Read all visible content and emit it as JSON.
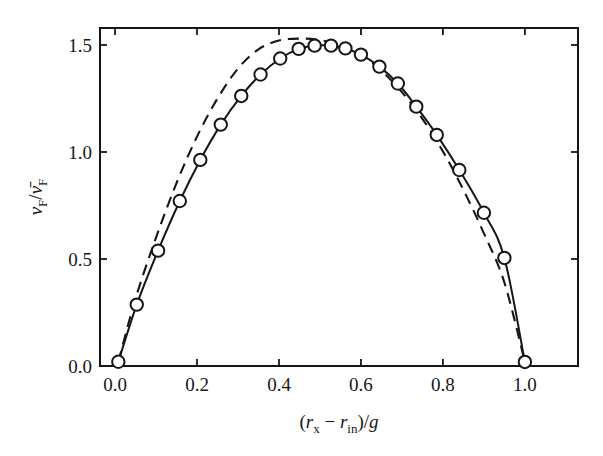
{
  "figure": {
    "title": "",
    "background_color": "#ffffff",
    "ink_color": "#161616"
  },
  "axes": {
    "x": {
      "label_parts": {
        "open_paren": "(",
        "r1": "r",
        "r1_sub": "x",
        "minus": "−",
        "r2": "r",
        "r2_sub": "in",
        "close_paren": ")",
        "slash": "/",
        "g": "g"
      },
      "label_plain": "(r_x − r_in)/g",
      "tick_labels": [
        "0.0",
        "0.2",
        "0.4",
        "0.6",
        "0.8",
        "1.0"
      ],
      "tick_values": [
        0.0,
        0.2,
        0.4,
        0.6,
        0.8,
        1.0
      ],
      "limits": [
        -0.0367,
        1.1296
      ],
      "minor_ticks": false,
      "tick_direction": "in"
    },
    "y": {
      "label_parts": {
        "nu1": "ν",
        "nu1_sub": "F",
        "slash": "/",
        "nu2_bar": "ν̄",
        "nu2_sub": "F"
      },
      "label_plain": "ν_F / ν̄_F",
      "tick_labels": [
        "0.0",
        "0.5",
        "1.0",
        "1.5"
      ],
      "tick_values": [
        0.0,
        0.5,
        1.0,
        1.5
      ],
      "limits": [
        0.0,
        1.5794
      ],
      "minor_ticks": false,
      "tick_direction": "in"
    },
    "frame": "full-box",
    "grid": false,
    "legend": null
  },
  "chart_data": {
    "type": "line",
    "title": "",
    "xlabel": "(r_x − r_in)/g",
    "ylabel": "ν_F / ν̄_F",
    "xlim": [
      -0.0367,
      1.1296
    ],
    "ylim": [
      0.0,
      1.5794
    ],
    "xticks": [
      0.0,
      0.2,
      0.4,
      0.6,
      0.8,
      1.0
    ],
    "yticks": [
      0.0,
      0.5,
      1.0,
      1.5
    ],
    "grid": false,
    "legend_position": "none",
    "series": [
      {
        "name": "measured-profile",
        "style": "solid-line-with-open-circle-markers",
        "marker": "open-circle",
        "linestyle": "solid",
        "color": "#161616",
        "x": [
          0.008,
          0.053,
          0.105,
          0.158,
          0.208,
          0.258,
          0.308,
          0.355,
          0.403,
          0.448,
          0.487,
          0.527,
          0.562,
          0.6,
          0.645,
          0.69,
          0.735,
          0.785,
          0.84,
          0.9,
          0.95,
          1.0
        ],
        "y": [
          0.02,
          0.287,
          0.539,
          0.771,
          0.963,
          1.128,
          1.262,
          1.362,
          1.437,
          1.482,
          1.497,
          1.497,
          1.484,
          1.455,
          1.399,
          1.32,
          1.212,
          1.08,
          0.916,
          0.716,
          0.505,
          0.019
        ]
      },
      {
        "name": "theoretical-profile",
        "style": "dashed-line",
        "marker": "none",
        "linestyle": "dashed",
        "color": "#161616",
        "x": [
          0.008,
          0.05,
          0.1,
          0.15,
          0.2,
          0.25,
          0.3,
          0.35,
          0.4,
          0.45,
          0.5,
          0.55,
          0.6,
          0.65,
          0.7,
          0.75,
          0.8,
          0.85,
          0.9,
          0.95,
          1.0
        ],
        "y": [
          0.02,
          0.315,
          0.6,
          0.855,
          1.072,
          1.25,
          1.39,
          1.48,
          1.521,
          1.53,
          1.523,
          1.5,
          1.455,
          1.38,
          1.28,
          1.155,
          1.003,
          0.823,
          0.62,
          0.39,
          0.019
        ]
      }
    ]
  }
}
